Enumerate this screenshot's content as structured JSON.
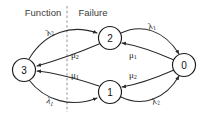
{
  "diagram": {
    "background_color": "#ffffff",
    "stroke_color": "#2a2a2a",
    "divider_color": "#9a9a9a",
    "regions": {
      "left_label": "Function",
      "right_label": "Failure"
    },
    "nodes": [
      {
        "id": "3",
        "label": "3",
        "cx": 24,
        "cy": 70,
        "r": 11.5
      },
      {
        "id": "2",
        "label": "2",
        "cx": 110,
        "cy": 38,
        "r": 11.5
      },
      {
        "id": "1",
        "label": "1",
        "cx": 110,
        "cy": 92,
        "r": 11.5
      },
      {
        "id": "0",
        "label": "0",
        "cx": 184,
        "cy": 65,
        "r": 11.5
      }
    ],
    "edge_labels": [
      {
        "key": "lambda2_top_left",
        "greek": "λ",
        "sub": "2",
        "x": 50,
        "y": 33
      },
      {
        "key": "lambda1_top_right",
        "greek": "λ",
        "sub": "1",
        "x": 152,
        "y": 27
      },
      {
        "key": "mu2_inner_upper_left",
        "greek": "μ",
        "sub": "2",
        "x": 75,
        "y": 56
      },
      {
        "key": "mu1_inner_upper_right",
        "greek": "μ",
        "sub": "1",
        "x": 133,
        "y": 56
      },
      {
        "key": "mu1_inner_lower_left",
        "greek": "μ",
        "sub": "1",
        "x": 75,
        "y": 76
      },
      {
        "key": "mu2_inner_lower_right",
        "greek": "μ",
        "sub": "2",
        "x": 133,
        "y": 76
      },
      {
        "key": "lambda1_bottom_left",
        "greek": "λ",
        "sub": "1",
        "x": 50,
        "y": 102
      },
      {
        "key": "lambda2_bottom_right",
        "greek": "λ",
        "sub": "2",
        "x": 156,
        "y": 102
      }
    ],
    "transitions": [
      {
        "from": "3",
        "to": "2",
        "rate": "λ2"
      },
      {
        "from": "3",
        "to": "1",
        "rate": "λ1"
      },
      {
        "from": "2",
        "to": "3",
        "rate": "μ2"
      },
      {
        "from": "1",
        "to": "3",
        "rate": "μ1"
      },
      {
        "from": "2",
        "to": "0",
        "rate": "λ1"
      },
      {
        "from": "1",
        "to": "0",
        "rate": "λ2"
      },
      {
        "from": "0",
        "to": "2",
        "rate": "μ1"
      },
      {
        "from": "0",
        "to": "1",
        "rate": "μ2"
      }
    ],
    "divider": {
      "x": 67,
      "y_top": 6,
      "y_bottom": 112
    }
  }
}
